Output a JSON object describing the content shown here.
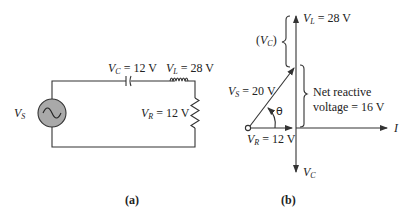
{
  "panel_a": {
    "caption": "(a)",
    "source_label": {
      "symbol": "V",
      "sub": "S"
    },
    "capacitor_label": {
      "symbol": "V",
      "sub": "C",
      "value": " = 12 V"
    },
    "inductor_label": {
      "symbol": "V",
      "sub": "L",
      "value": " = 28 V"
    },
    "resistor_label": {
      "symbol": "V",
      "sub": "R",
      "value": " = 12 V"
    }
  },
  "panel_b": {
    "caption": "(b)",
    "vl_label": {
      "symbol": "V",
      "sub": "L",
      "value": " = 28 V"
    },
    "vc_bracket_label": {
      "open": "(",
      "symbol": "V",
      "sub": "C",
      "close": ")"
    },
    "vs_label": {
      "symbol": "V",
      "sub": "S",
      "value": " = 20 V"
    },
    "angle_label": "θ",
    "net_reactive_line1": "Net reactive",
    "net_reactive_line2": "voltage = 16 V",
    "vr_label": {
      "symbol": "V",
      "sub": "R",
      "value": " = 12 V"
    },
    "current_axis_label": "I",
    "vc_axis_label": {
      "symbol": "V",
      "sub": "C"
    }
  },
  "colors": {
    "line": "#333333",
    "source_fill": "#a9a9a9"
  }
}
